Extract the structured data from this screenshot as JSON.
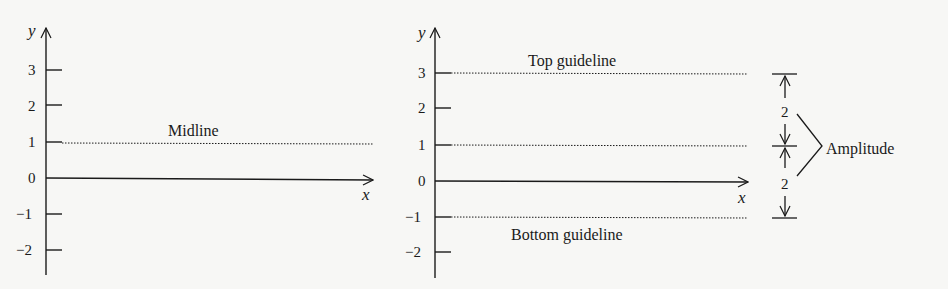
{
  "left_chart": {
    "y_axis_label": "y",
    "x_axis_label": "x",
    "y_ticks": [
      "3",
      "2",
      "1",
      "0",
      "−1",
      "−2"
    ],
    "midline_label": "Midline",
    "midline_value": 1
  },
  "right_chart": {
    "y_axis_label": "y",
    "x_axis_label": "x",
    "y_ticks": [
      "3",
      "2",
      "1",
      "0",
      "−1",
      "−2"
    ],
    "top_guideline_label": "Top guideline",
    "bottom_guideline_label": "Bottom guideline",
    "top_value": 3,
    "midline_value": 1,
    "bottom_value": -1,
    "upper_distance": "2",
    "lower_distance": "2",
    "amplitude_label": "Amplitude"
  },
  "colors": {
    "ink": "#1a1a1a",
    "background": "#f7f7f5"
  }
}
